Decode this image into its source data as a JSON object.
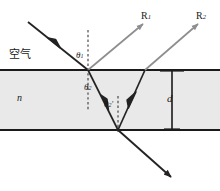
{
  "figure": {
    "width": 220,
    "height": 191
  },
  "colors": {
    "slab_fill": "#e9e9e9",
    "slab_border": "#1a1a1a",
    "ray_dark": "#232323",
    "ray_gray": "#8e8e8e",
    "normal_dash": "#3a3a3a",
    "dimension": "#1a1a1a",
    "text": "#1a1a1a"
  },
  "labels": {
    "medium_above": "空气",
    "refractive_index": "n",
    "thickness": "d",
    "reflected_ray_1": "R",
    "reflected_ray_1_sub": "1",
    "reflected_ray_2": "R",
    "reflected_ray_2_sub": "2",
    "angle_incidence": "θ",
    "angle_incidence_sub": "1",
    "angle_refraction": "θ",
    "angle_refraction_sub": "2",
    "angle_internal": "θ",
    "angle_internal_sub": "2",
    "angle_internal_prime": "′"
  },
  "geometry": {
    "slab": {
      "top_y": 70,
      "bottom_y": 130,
      "left_x": 0,
      "right_x": 220
    },
    "incidence_point": {
      "x": 88,
      "y": 70
    },
    "bottom_point": {
      "x": 118,
      "y": 130
    },
    "exit_point": {
      "x": 145,
      "y": 70
    },
    "normals_x": [
      88,
      118
    ],
    "dimension_line_x": 172,
    "rays": {
      "incident": {
        "from": [
          28,
          22
        ],
        "to": [
          88,
          70
        ]
      },
      "reflected_r1": {
        "from": [
          88,
          70
        ],
        "to": [
          143,
          24
        ]
      },
      "refracted": {
        "from": [
          88,
          70
        ],
        "to": [
          118,
          130
        ]
      },
      "internal": {
        "from": [
          118,
          130
        ],
        "to": [
          145,
          70
        ]
      },
      "reflected_r2": {
        "from": [
          145,
          70
        ],
        "to": [
          198,
          24
        ]
      },
      "transmitted": {
        "from": [
          118,
          130
        ],
        "to": [
          171,
          177
        ]
      }
    }
  }
}
